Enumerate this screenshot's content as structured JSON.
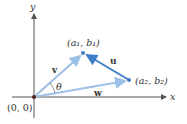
{
  "diagram": {
    "axes": {
      "x_label": "x",
      "y_label": "y"
    },
    "origin_label": "(0, 0)",
    "angle_label": "θ",
    "points": {
      "p1": {
        "label": "(a₁, b₁)"
      },
      "p2": {
        "label": "(a₂, b₂)"
      }
    },
    "vectors": {
      "v": {
        "label": "v"
      },
      "w": {
        "label": "w"
      },
      "u": {
        "label": "u"
      }
    },
    "colors": {
      "axis": "#555555",
      "vector_light": "#9cc0e6",
      "vector_dark": "#3f7fc6",
      "origin_dot": "#5a1a1a"
    }
  }
}
